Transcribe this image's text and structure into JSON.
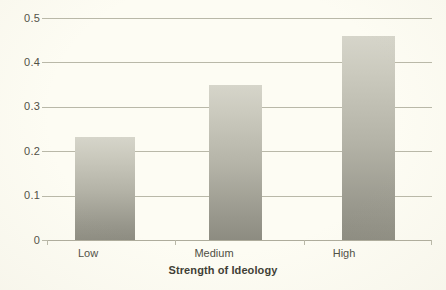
{
  "chart_data": {
    "type": "bar",
    "title": "",
    "subtitle": "",
    "xlabel": "Strength of Ideology",
    "ylabel": "",
    "categories": [
      "Low",
      "Medium",
      "High"
    ],
    "values": [
      0.233,
      0.35,
      0.46
    ],
    "series": [
      {
        "name": "Proportion",
        "values": [
          0.233,
          0.35,
          0.46
        ]
      }
    ],
    "ylim": [
      0,
      0.5
    ],
    "ytick_labels": [
      "0",
      "0.1",
      "0.2",
      "0.3",
      "0.4",
      "0.5"
    ],
    "ytick_values": [
      0,
      0.1,
      0.2,
      0.3,
      0.4,
      0.5
    ],
    "grid": "horizontal",
    "legend": "none",
    "annotations": [],
    "colors": {
      "background": "#fdfcf3",
      "bar_top": "#d6d5ca",
      "bar_bottom": "#8d8c81",
      "gridline": "#b9b8a8",
      "axis_text": "#4f4e44",
      "axis_title": "#3d3c33"
    }
  },
  "axis": {
    "x_title": "Strength of Ideology",
    "x_tick_labels": [
      "Low",
      "Medium",
      "High"
    ],
    "y_tick_labels": [
      "0.5",
      "0.4",
      "0.3",
      "0.2",
      "0.1",
      "0"
    ]
  }
}
